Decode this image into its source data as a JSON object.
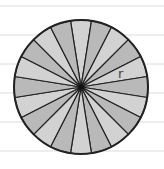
{
  "diagram": {
    "type": "circle-divided-into-sectors",
    "sector_count": 20,
    "center": [
      81,
      87
    ],
    "radius": 67,
    "radius_label": "r",
    "label_position": [
      118,
      78
    ],
    "colors": {
      "sector_light": "#d2d2d2",
      "sector_dark": "#b9b9b9",
      "outline": "#222222",
      "ruled_line": "#dcdcdc",
      "background": "#ffffff",
      "label": "#444444"
    }
  },
  "ruled_lines_y": [
    6,
    35,
    64,
    93,
    122,
    151
  ]
}
